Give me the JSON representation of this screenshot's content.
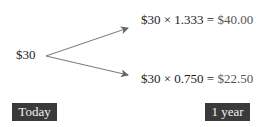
{
  "diagram": {
    "start_value": "$30",
    "up": {
      "lhs": "$30 × 1.333 = ",
      "result": "$40.00"
    },
    "down": {
      "lhs": "$30 × 0.750 = ",
      "result": "$22.50"
    },
    "labels": {
      "start": "Today",
      "end": "1 year"
    },
    "colors": {
      "arrow": "#666666",
      "label_bg": "#3a3a3a"
    }
  }
}
